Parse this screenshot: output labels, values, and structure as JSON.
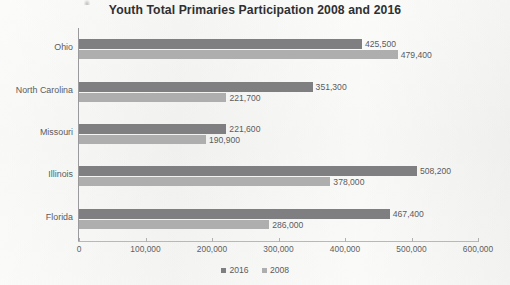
{
  "chart_data": {
    "type": "bar",
    "orientation": "horizontal",
    "title": "Youth Total Primaries Participation 2008 and 2016",
    "xlabel": "",
    "ylabel": "",
    "categories": [
      "Ohio",
      "North Carolina",
      "Missouri",
      "Illinois",
      "Florida"
    ],
    "series": [
      {
        "name": "2016",
        "color": "#7f7f81",
        "values": [
          425500,
          351300,
          221600,
          508200,
          467400
        ],
        "value_labels": [
          "425,500",
          "351,300",
          "221,600",
          "508,200",
          "467,400"
        ]
      },
      {
        "name": "2008",
        "color": "#aeaeae",
        "values": [
          479400,
          221700,
          190900,
          378000,
          286000
        ],
        "value_labels": [
          "479,400",
          "221,700",
          "190,900",
          "378,000",
          "286,000"
        ]
      }
    ],
    "xlim": [
      0,
      600000
    ],
    "xticks": [
      0,
      100000,
      200000,
      300000,
      400000,
      500000,
      600000
    ],
    "xtick_labels": [
      "0",
      "100,000",
      "200,000",
      "300,000",
      "400,000",
      "500,000",
      "600,000"
    ],
    "grid": false,
    "legend_position": "bottom",
    "legend_entries": [
      "2016",
      "2008"
    ]
  }
}
